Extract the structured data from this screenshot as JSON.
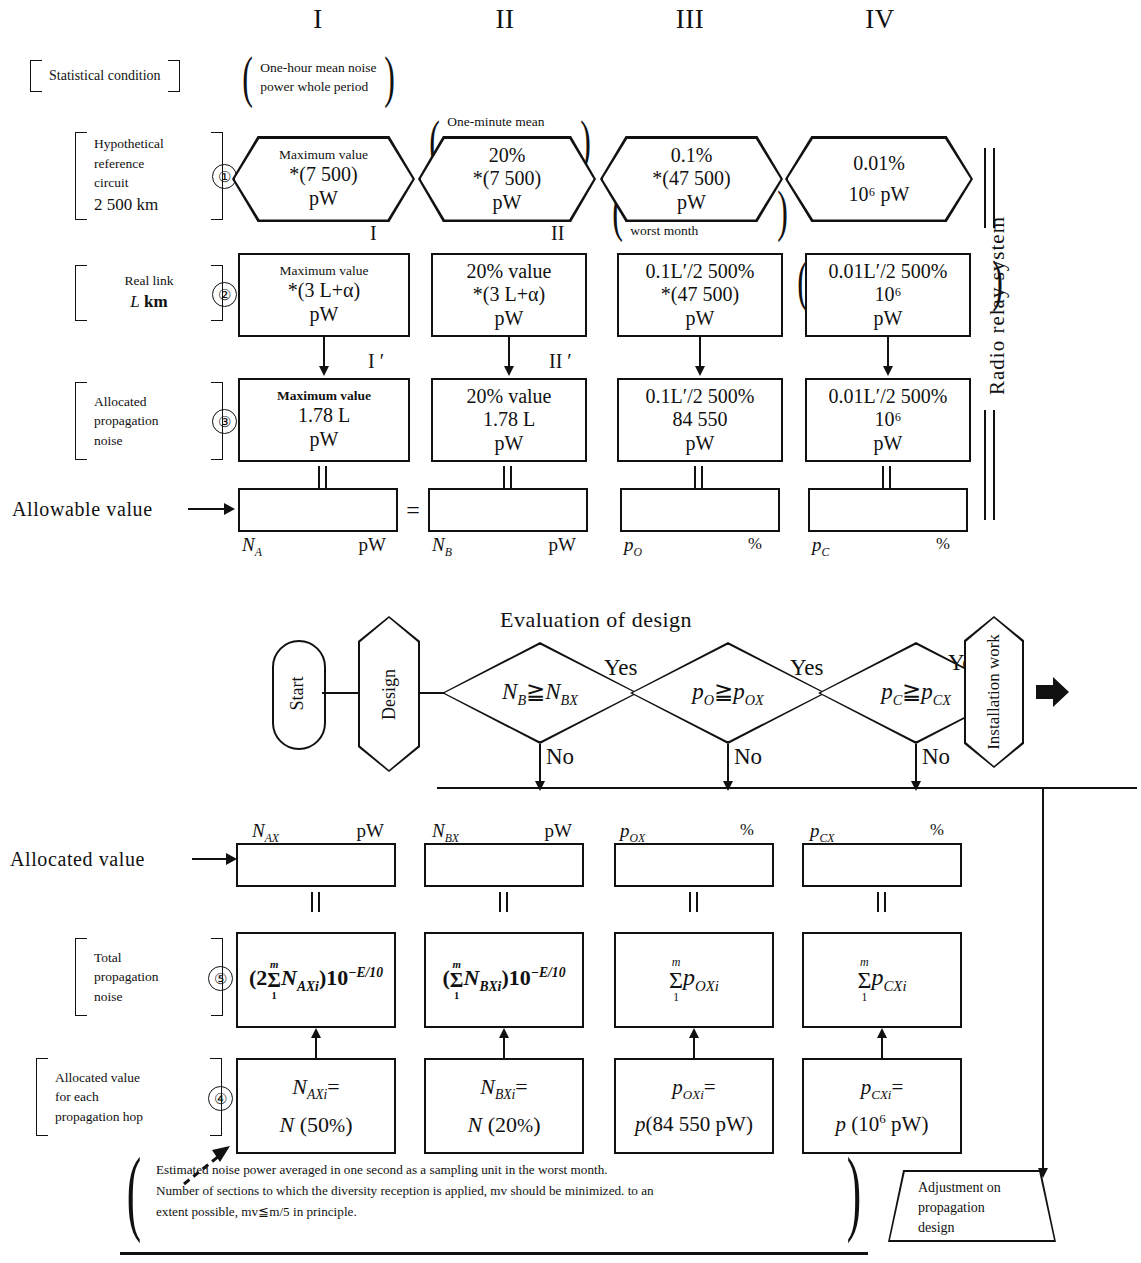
{
  "diagram": {
    "row_labels": {
      "statistical_condition": "Statistical condition",
      "hypothetical_reference_circuit": [
        "Hypothetical",
        "reference",
        "circuit",
        "2 500 km"
      ],
      "real_link": [
        "Real link",
        "L km"
      ],
      "allocated_propagation_noise": [
        "Allocated",
        "propagation",
        "noise"
      ],
      "allowable_value": "Allowable value",
      "allocated_value": "Allocated value",
      "total_propagation_noise": [
        "Total",
        "propagation",
        "noise"
      ],
      "allocated_value_each_hop": [
        "Allocated value",
        "for each",
        "propagation hop"
      ]
    },
    "step_numbers": {
      "s1": "①",
      "s2": "②",
      "s3": "③",
      "s4": "④",
      "s5": "⑤"
    },
    "columns": [
      {
        "roman": "I",
        "condition": [
          "One-hour mean noise",
          "power whole period"
        ],
        "hrc": {
          "l1": "Maximum value",
          "l2": "*(7 500)",
          "l3": "pW"
        },
        "link_tag": "I",
        "real": {
          "l1": "Maximum value",
          "l2": "*(3 L+α)",
          "l3": "pW"
        },
        "alloc_tag": "I ′",
        "alloc": {
          "l1": "Maximum value",
          "l2": "1.78 L",
          "l3": "pW"
        },
        "allowable_sym": "N",
        "allowable_sub": "A",
        "allowable_unit": "pW",
        "allocated_sym": "N",
        "allocated_sub": "AX",
        "allocated_unit": "pW",
        "total_formula": "(2Σ N_AXi) 10^-E/10",
        "hop_l1": "N_AXi =",
        "hop_l2": "N (50%)"
      },
      {
        "roman": "II",
        "condition": [
          "One-minute mean",
          "noise power",
          "worst month"
        ],
        "hrc": {
          "l1": "20%",
          "l2": "*(7 500)",
          "l3": "pW"
        },
        "link_tag": "II",
        "real": {
          "l1": "20% value",
          "l2": "*(3 L+α)",
          "l3": "pW"
        },
        "alloc_tag": "II ′",
        "alloc": {
          "l1": "20% value",
          "l2": "1.78 L",
          "l3": "pW"
        },
        "allowable_sym": "N",
        "allowable_sub": "B",
        "allowable_unit": "pW",
        "allocated_sym": "N",
        "allocated_sub": "BX",
        "allocated_unit": "pW",
        "total_formula": "(Σ N_BXi) 10^-E/10",
        "hop_l1": "N_BXi =",
        "hop_l2": "N (20%)"
      },
      {
        "roman": "III",
        "condition": [
          "One-minute mean",
          "noise power",
          "worst month"
        ],
        "hrc": {
          "l1": "0.1%",
          "l2": "*(47 500)",
          "l3": "pW"
        },
        "link_tag": "",
        "real": {
          "l1": "0.1L′/2 500%",
          "l2": "*(47 500)",
          "l3": "pW"
        },
        "alloc_tag": "",
        "alloc": {
          "l1": "0.1L′/2 500%",
          "l2": "84 550",
          "l3": "pW"
        },
        "allowable_sym": "p",
        "allowable_sub": "O",
        "allowable_unit": "%",
        "allocated_sym": "p",
        "allocated_sub": "OX",
        "allocated_unit": "%",
        "total_formula": "Σ p_OXi",
        "hop_l1": "p_OXi =",
        "hop_l2": "p(84 550 pW)"
      },
      {
        "roman": "IV",
        "condition": [
          "Noise power measured",
          "with 5 ms integrating",
          "time worst month"
        ],
        "hrc": {
          "l1": "0.01%",
          "l2": "10⁶ pW",
          "l3": ""
        },
        "link_tag": "",
        "real": {
          "l1": "0.01L′/2 500%",
          "l2": "10⁶",
          "l3": "pW"
        },
        "alloc_tag": "",
        "alloc": {
          "l1": "0.01L′/2 500%",
          "l2": "10⁶",
          "l3": "pW"
        },
        "allowable_sym": "p",
        "allowable_sub": "C",
        "allowable_unit": "%",
        "allocated_sym": "p",
        "allocated_sub": "CX",
        "allocated_unit": "%",
        "total_formula": "Σ p_CXi",
        "hop_l1": "p_CXi =",
        "hop_l2": "p (10⁶ pW)"
      }
    ],
    "side_label": "Radio relay system",
    "allowable_equals_sign": "=",
    "flowchart": {
      "title": "Evaluation of design",
      "start": "Start",
      "design": "Design",
      "decisions": [
        {
          "expr_left": "N",
          "expr_left_sub": "B",
          "expr_right": "N",
          "expr_right_sub": "BX",
          "yes": "Yes",
          "no": "No"
        },
        {
          "expr_left": "p",
          "expr_left_sub": "O",
          "expr_right": "p",
          "expr_right_sub": "OX",
          "yes": "Yes",
          "no": "No"
        },
        {
          "expr_left": "p",
          "expr_left_sub": "C",
          "expr_right": "p",
          "expr_right_sub": "CX",
          "yes": "Yes",
          "no": "No"
        }
      ],
      "installation": "Installation work",
      "adjustment": [
        "Adjustment on",
        "propagation",
        "design"
      ]
    },
    "footnote": [
      "Estimated noise power averaged in one second as a sampling unit in the worst month.",
      "Number of sections to which the diversity reception is applied, mv should be minimized. to an",
      "extent possible, mv≦m/5 in principle."
    ]
  }
}
